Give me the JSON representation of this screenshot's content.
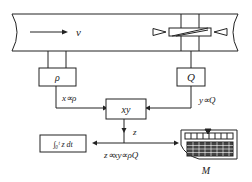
{
  "pipe": {
    "velocity_label": "v"
  },
  "density_block": {
    "label": "ρ",
    "signal_label": "x∝ρ"
  },
  "flow_block": {
    "label": "Q",
    "signal_label": "y∝Q"
  },
  "multiplier_block": {
    "label": "xy"
  },
  "output": {
    "signal_label": "z",
    "relation_label": "z∝xy∝ρQ"
  },
  "integrator_block": {
    "label": "∫₀ᵗ z dt"
  },
  "meter": {
    "label": "M"
  },
  "colors": {
    "line": "#222222",
    "background": "#ffffff"
  }
}
